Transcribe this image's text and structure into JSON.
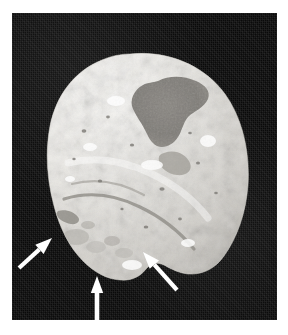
{
  "figure": {
    "domain": "natural-image",
    "kind": "grayscale-photograph",
    "caption": "",
    "background_color": "#ffffff",
    "plate_color": "#0a0a0a",
    "plate": {
      "x": 12,
      "y": 13,
      "width": 265,
      "height": 307
    }
  },
  "specimen": {
    "name": "bone-specimen",
    "label": "",
    "highlight_color": "#f2f0ec",
    "midtone_color": "#c9c6c0",
    "shadow_color": "#8e8b86",
    "lesion_color": "#7e7c78",
    "description": "ovoid pale bone with irregular surface texture, a dark depressed lesion in the upper right quadrant, and a rounded inferior protuberance"
  },
  "annotations": {
    "arrow_color": "#ffffff",
    "count": 3,
    "items": [
      {
        "name": "arrow-left",
        "label": "",
        "direction": "up-right",
        "tip": {
          "x": 52,
          "y": 238
        },
        "tail": {
          "x": 19,
          "y": 268
        }
      },
      {
        "name": "arrow-bottom",
        "label": "",
        "direction": "up",
        "tip": {
          "x": 97,
          "y": 276
        },
        "tail": {
          "x": 97,
          "y": 320
        }
      },
      {
        "name": "arrow-right",
        "label": "",
        "direction": "up-left",
        "tip": {
          "x": 143,
          "y": 252
        },
        "tail": {
          "x": 177,
          "y": 290
        }
      }
    ]
  }
}
